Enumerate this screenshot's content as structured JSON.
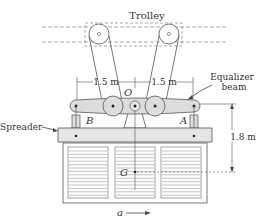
{
  "labels": {
    "trolley": "Trolley",
    "dim_left": "1.5 m",
    "dim_right": "1.5 m",
    "pivot": "O",
    "equalizer_line1": "Equalizer",
    "equalizer_line2": "beam",
    "spreader": "Spreader",
    "point_b": "B",
    "point_a": "A",
    "height_dim": "1.8 m",
    "center_of_mass": "G",
    "acceleration": "a"
  },
  "colors": {
    "line": "#555555",
    "beam_fill": "#dcdcdc",
    "spreader_fill": "#e6e6e6",
    "dashed": "#888888"
  }
}
